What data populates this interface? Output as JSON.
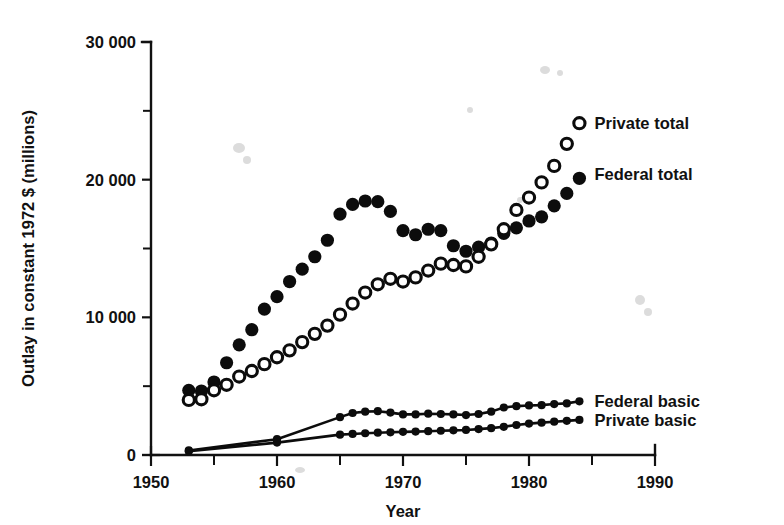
{
  "chart_data": {
    "type": "scatter",
    "title": "",
    "xlabel": "Year",
    "ylabel": "Outlay in constant 1972 $ (millions)",
    "xlim": [
      1950,
      1990
    ],
    "ylim": [
      0,
      30000
    ],
    "xticks": [
      1950,
      1960,
      1970,
      1980,
      1990
    ],
    "xtick_labels": [
      "1950",
      "1960",
      "1970",
      "1980",
      "1990"
    ],
    "xticks_minor": [
      1955,
      1965,
      1975,
      1985
    ],
    "yticks": [
      0,
      10000,
      20000,
      30000
    ],
    "ytick_labels": [
      "0",
      "10 000",
      "20 000",
      "30 000"
    ],
    "yticks_minor": [
      5000,
      15000,
      25000
    ],
    "grid": false,
    "legend_position": "right-inline-annotations",
    "series": [
      {
        "name": "Federal total",
        "marker": "filled-circle",
        "style": "markers",
        "label_x": 1985.2,
        "label_y": 20400,
        "x": [
          1953,
          1954,
          1955,
          1956,
          1957,
          1958,
          1959,
          1960,
          1961,
          1962,
          1963,
          1964,
          1965,
          1966,
          1967,
          1968,
          1969,
          1970,
          1971,
          1972,
          1973,
          1974,
          1975,
          1976,
          1977,
          1978,
          1979,
          1980,
          1981,
          1982,
          1983,
          1984
        ],
        "y": [
          4700,
          4650,
          5300,
          6700,
          8000,
          9100,
          10600,
          11500,
          12600,
          13500,
          14400,
          15600,
          17500,
          18200,
          18450,
          18400,
          17700,
          16300,
          16000,
          16400,
          16300,
          15200,
          14800,
          15100,
          15400,
          16100,
          16500,
          17000,
          17300,
          18100,
          19000,
          20100
        ],
        "unit": "millions of constant 1972 $"
      },
      {
        "name": "Private total",
        "marker": "open-circle",
        "style": "markers",
        "label_x": 1985.2,
        "label_y": 24100,
        "x": [
          1953,
          1954,
          1955,
          1956,
          1957,
          1958,
          1959,
          1960,
          1961,
          1962,
          1963,
          1964,
          1965,
          1966,
          1967,
          1968,
          1969,
          1970,
          1971,
          1972,
          1973,
          1974,
          1975,
          1976,
          1977,
          1978,
          1979,
          1980,
          1981,
          1982,
          1983,
          1984
        ],
        "y": [
          4000,
          4050,
          4700,
          5100,
          5700,
          6100,
          6600,
          7100,
          7600,
          8200,
          8800,
          9400,
          10200,
          11000,
          11800,
          12400,
          12800,
          12600,
          12900,
          13400,
          13900,
          13800,
          13700,
          14400,
          15300,
          16400,
          17800,
          18700,
          19800,
          21000,
          22600,
          24100
        ],
        "unit": "millions of constant 1972 $"
      },
      {
        "name": "Federal basic",
        "marker": "filled-circle-small",
        "style": "line+markers",
        "label_x": 1985.2,
        "label_y": 3900,
        "x": [
          1953,
          1960,
          1965,
          1966,
          1967,
          1968,
          1969,
          1970,
          1971,
          1972,
          1973,
          1974,
          1975,
          1976,
          1977,
          1978,
          1979,
          1980,
          1981,
          1982,
          1983,
          1984
        ],
        "y": [
          330,
          1150,
          2750,
          3050,
          3150,
          3180,
          3080,
          2950,
          2950,
          3000,
          2980,
          2950,
          2900,
          2980,
          3150,
          3450,
          3550,
          3600,
          3620,
          3700,
          3750,
          3900
        ],
        "unit": "millions of constant 1972 $"
      },
      {
        "name": "Private basic",
        "marker": "filled-circle-small",
        "style": "line+markers",
        "label_x": 1985.2,
        "label_y": 2550,
        "x": [
          1953,
          1960,
          1965,
          1966,
          1967,
          1968,
          1969,
          1970,
          1971,
          1972,
          1973,
          1974,
          1975,
          1976,
          1977,
          1978,
          1979,
          1980,
          1981,
          1982,
          1983,
          1984
        ],
        "y": [
          280,
          900,
          1480,
          1530,
          1580,
          1620,
          1650,
          1680,
          1700,
          1730,
          1760,
          1790,
          1820,
          1880,
          1950,
          2050,
          2180,
          2280,
          2350,
          2420,
          2480,
          2550
        ],
        "unit": "millions of constant 1972 $"
      }
    ]
  },
  "axes": {
    "x_title": "Year",
    "y_title": "Outlay in constant 1972 $ (millions)"
  },
  "labels": {
    "private_total": "Private total",
    "federal_total": "Federal total",
    "federal_basic": "Federal basic",
    "private_basic": "Private basic"
  },
  "colors": {
    "ink": "#0c0c0c",
    "background": "#ffffff"
  }
}
